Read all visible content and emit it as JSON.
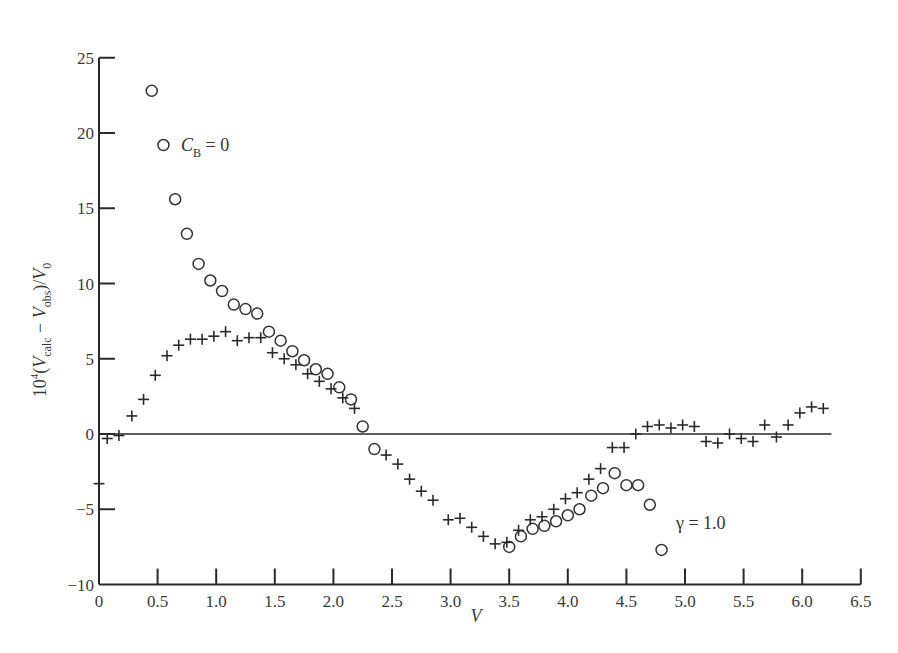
{
  "chart_data": {
    "type": "scatter",
    "title": "",
    "xlabel": "V",
    "ylabel": "10^4 (V_calc − V_obs)/V_0",
    "xlim": [
      0,
      6.5
    ],
    "ylim": [
      -10,
      25
    ],
    "x_ticks": [
      "0",
      "0.5",
      "1.0",
      "1.5",
      "2.0",
      "2.5",
      "3.0",
      "3.5",
      "4.0",
      "4.5",
      "5.0",
      "5.5",
      "6.0",
      "6.5"
    ],
    "y_ticks": [
      "25",
      "20",
      "15",
      "10",
      "5",
      "0",
      "−5",
      "−10"
    ],
    "reference_line": {
      "y": 0,
      "x_from": 0,
      "x_to": 6.25
    },
    "grid": false,
    "series": [
      {
        "name": "C_B = 0",
        "marker": "circle",
        "points": [
          [
            0.45,
            22.8
          ],
          [
            0.55,
            19.2
          ],
          [
            0.65,
            15.6
          ],
          [
            0.75,
            13.3
          ],
          [
            0.85,
            11.3
          ],
          [
            0.95,
            10.2
          ],
          [
            1.05,
            9.5
          ],
          [
            1.15,
            8.6
          ],
          [
            1.25,
            8.3
          ],
          [
            1.35,
            8.0
          ],
          [
            1.45,
            6.8
          ],
          [
            1.55,
            6.2
          ],
          [
            1.65,
            5.5
          ],
          [
            1.75,
            4.9
          ],
          [
            1.85,
            4.3
          ],
          [
            1.95,
            4.0
          ],
          [
            2.05,
            3.1
          ],
          [
            2.15,
            2.3
          ],
          [
            2.25,
            0.5
          ],
          [
            2.35,
            -1.0
          ],
          [
            3.5,
            -7.5
          ],
          [
            3.6,
            -6.8
          ],
          [
            3.7,
            -6.3
          ],
          [
            3.8,
            -6.1
          ],
          [
            3.9,
            -5.8
          ],
          [
            4.0,
            -5.4
          ],
          [
            4.1,
            -5.0
          ],
          [
            4.2,
            -4.1
          ],
          [
            4.3,
            -3.6
          ],
          [
            4.4,
            -2.6
          ],
          [
            4.5,
            -3.4
          ],
          [
            4.6,
            -3.4
          ],
          [
            4.7,
            -4.7
          ],
          [
            4.8,
            -7.7
          ]
        ]
      },
      {
        "name": "γ = 1.0",
        "marker": "plus",
        "points": [
          [
            0.0,
            -3.3
          ],
          [
            0.07,
            -0.3
          ],
          [
            0.17,
            -0.1
          ],
          [
            0.28,
            1.2
          ],
          [
            0.38,
            2.3
          ],
          [
            0.48,
            3.9
          ],
          [
            0.58,
            5.2
          ],
          [
            0.68,
            5.9
          ],
          [
            0.78,
            6.3
          ],
          [
            0.88,
            6.3
          ],
          [
            0.98,
            6.5
          ],
          [
            1.08,
            6.8
          ],
          [
            1.18,
            6.2
          ],
          [
            1.28,
            6.4
          ],
          [
            1.38,
            6.4
          ],
          [
            1.48,
            5.4
          ],
          [
            1.58,
            5.0
          ],
          [
            1.68,
            4.6
          ],
          [
            1.78,
            4.0
          ],
          [
            1.88,
            3.5
          ],
          [
            1.98,
            3.0
          ],
          [
            2.08,
            2.4
          ],
          [
            2.18,
            1.7
          ],
          [
            2.45,
            -1.4
          ],
          [
            2.55,
            -2.0
          ],
          [
            2.65,
            -3.0
          ],
          [
            2.75,
            -3.8
          ],
          [
            2.85,
            -4.4
          ],
          [
            2.98,
            -5.7
          ],
          [
            3.08,
            -5.6
          ],
          [
            3.18,
            -6.2
          ],
          [
            3.28,
            -6.8
          ],
          [
            3.38,
            -7.3
          ],
          [
            3.48,
            -7.2
          ],
          [
            3.58,
            -6.4
          ],
          [
            3.68,
            -5.7
          ],
          [
            3.78,
            -5.5
          ],
          [
            3.88,
            -5.0
          ],
          [
            3.98,
            -4.3
          ],
          [
            4.08,
            -3.9
          ],
          [
            4.18,
            -3.0
          ],
          [
            4.28,
            -2.3
          ],
          [
            4.38,
            -0.9
          ],
          [
            4.48,
            -0.9
          ],
          [
            4.58,
            0.0
          ],
          [
            4.68,
            0.5
          ],
          [
            4.78,
            0.6
          ],
          [
            4.88,
            0.4
          ],
          [
            4.98,
            0.6
          ],
          [
            5.08,
            0.5
          ],
          [
            5.18,
            -0.5
          ],
          [
            5.28,
            -0.6
          ],
          [
            5.38,
            0.0
          ],
          [
            5.48,
            -0.3
          ],
          [
            5.58,
            -0.5
          ],
          [
            5.68,
            0.6
          ],
          [
            5.78,
            -0.2
          ],
          [
            5.88,
            0.6
          ],
          [
            5.98,
            1.4
          ],
          [
            6.08,
            1.8
          ],
          [
            6.18,
            1.7
          ]
        ]
      }
    ],
    "annotations": [
      {
        "text": "C_B = 0",
        "x": 0.62,
        "y": 19.2
      },
      {
        "text": "γ = 1.0",
        "x": 4.98,
        "y": -5.6
      }
    ]
  },
  "labels": {
    "xlabel": "V",
    "annot_cb_main": "C",
    "annot_cb_sub": "B",
    "annot_cb_rest": " = 0",
    "annot_gamma": "γ = 1.0"
  }
}
